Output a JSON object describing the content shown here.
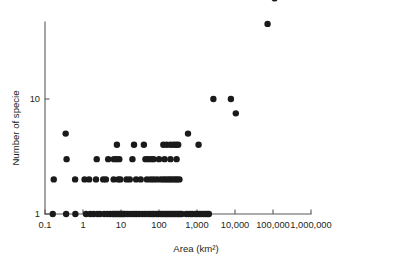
{
  "chart_data": {
    "type": "scatter",
    "title": "",
    "xlabel": "Area (km2)",
    "xlabel_display": "Area (km²)",
    "ylabel": "Number of specie",
    "xscale": "log",
    "yscale": "log",
    "xlim": [
      0.1,
      1000000
    ],
    "ylim": [
      1,
      100
    ],
    "grid": false,
    "legend": null,
    "xticks": [
      0.1,
      1,
      10,
      100,
      1000,
      10000,
      100000,
      1000000
    ],
    "xtick_labels": [
      "0.1",
      "1",
      "10",
      "100",
      "1,000",
      "10,000",
      "100,000",
      "1,000,000"
    ],
    "yticks": [
      1,
      10
    ],
    "ytick_labels": [
      "1",
      "10"
    ],
    "marker": "circle",
    "marker_color": "#1a1a1a",
    "marker_size": 4.6,
    "points": [
      [
        0.16,
        1
      ],
      [
        0.36,
        1
      ],
      [
        0.63,
        1
      ],
      [
        1.2,
        1
      ],
      [
        1.55,
        1
      ],
      [
        1.9,
        1
      ],
      [
        2.4,
        1
      ],
      [
        2.8,
        1
      ],
      [
        3.6,
        1
      ],
      [
        4.4,
        1
      ],
      [
        5.2,
        1
      ],
      [
        6.0,
        1
      ],
      [
        6.6,
        1
      ],
      [
        7.2,
        1
      ],
      [
        8.0,
        1
      ],
      [
        8.8,
        1
      ],
      [
        9.6,
        1
      ],
      [
        10.5,
        1
      ],
      [
        11.5,
        1
      ],
      [
        12.5,
        1
      ],
      [
        14.5,
        1
      ],
      [
        17,
        1
      ],
      [
        20,
        1
      ],
      [
        23,
        1
      ],
      [
        26,
        1
      ],
      [
        30,
        1
      ],
      [
        36,
        1
      ],
      [
        42,
        1
      ],
      [
        50,
        1
      ],
      [
        58,
        1
      ],
      [
        66,
        1
      ],
      [
        74,
        1
      ],
      [
        85,
        1
      ],
      [
        95,
        1
      ],
      [
        108,
        1
      ],
      [
        120,
        1
      ],
      [
        135,
        1
      ],
      [
        150,
        1
      ],
      [
        165,
        1
      ],
      [
        180,
        1
      ],
      [
        200,
        1
      ],
      [
        220,
        1
      ],
      [
        245,
        1
      ],
      [
        270,
        1
      ],
      [
        300,
        1
      ],
      [
        330,
        1
      ],
      [
        360,
        1
      ],
      [
        400,
        1
      ],
      [
        520,
        1
      ],
      [
        600,
        1
      ],
      [
        680,
        1
      ],
      [
        760,
        1
      ],
      [
        900,
        1
      ],
      [
        1000,
        1
      ],
      [
        1150,
        1
      ],
      [
        1300,
        1
      ],
      [
        1500,
        1
      ],
      [
        1700,
        1
      ],
      [
        1900,
        1
      ],
      [
        2050,
        1
      ],
      [
        0.17,
        2
      ],
      [
        0.62,
        2
      ],
      [
        1.1,
        2
      ],
      [
        1.45,
        2
      ],
      [
        2.2,
        2
      ],
      [
        3.4,
        2
      ],
      [
        4.0,
        2
      ],
      [
        6.4,
        2
      ],
      [
        8.5,
        2
      ],
      [
        9.6,
        2
      ],
      [
        14,
        2
      ],
      [
        17,
        2
      ],
      [
        25,
        2
      ],
      [
        33,
        2
      ],
      [
        48,
        2
      ],
      [
        60,
        2
      ],
      [
        72,
        2
      ],
      [
        88,
        2
      ],
      [
        110,
        2
      ],
      [
        130,
        2
      ],
      [
        150,
        2
      ],
      [
        175,
        2
      ],
      [
        200,
        2
      ],
      [
        230,
        2
      ],
      [
        265,
        2
      ],
      [
        300,
        2
      ],
      [
        345,
        2
      ],
      [
        0.37,
        3
      ],
      [
        2.3,
        3
      ],
      [
        4.6,
        3
      ],
      [
        6.5,
        3
      ],
      [
        7.6,
        3
      ],
      [
        9.0,
        3
      ],
      [
        20,
        3
      ],
      [
        44,
        3
      ],
      [
        52,
        3
      ],
      [
        62,
        3
      ],
      [
        72,
        3
      ],
      [
        100,
        3
      ],
      [
        140,
        3
      ],
      [
        200,
        3
      ],
      [
        290,
        3
      ],
      [
        7.8,
        4
      ],
      [
        22,
        4
      ],
      [
        40,
        4
      ],
      [
        130,
        4
      ],
      [
        160,
        4
      ],
      [
        200,
        4
      ],
      [
        240,
        4
      ],
      [
        280,
        4
      ],
      [
        320,
        4
      ],
      [
        1100,
        4
      ],
      [
        0.35,
        5
      ],
      [
        580,
        5
      ],
      [
        2700,
        10
      ],
      [
        7800,
        10
      ],
      [
        10500,
        7.5
      ],
      [
        72000,
        45
      ],
      [
        110000,
        75
      ]
    ]
  }
}
